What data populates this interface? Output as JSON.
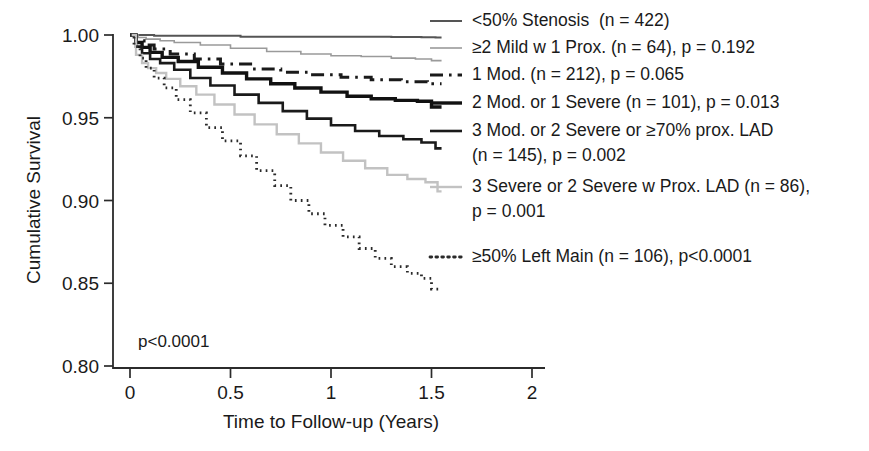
{
  "figure": {
    "background": "#ffffff",
    "annotation": "p<0.0001"
  },
  "chart_data": {
    "type": "line",
    "subtype": "kaplan-meier-survival",
    "title": "",
    "xlabel": "Time to Follow-up (Years)",
    "ylabel": "Cumulative Survival",
    "xlim": [
      0,
      2
    ],
    "ylim": [
      0.8,
      1.0
    ],
    "xticks": [
      0,
      0.5,
      1,
      1.5,
      2
    ],
    "xtick_labels": [
      "0",
      "0.5",
      "1",
      "1.5",
      "2"
    ],
    "yticks": [
      0.8,
      0.85,
      0.9,
      0.95,
      1.0
    ],
    "ytick_labels": [
      "0.80",
      "0.85",
      "0.90",
      "0.95",
      "1.00"
    ],
    "grid": false,
    "legend_position": "right",
    "overall_p_value": "p<0.0001",
    "series": [
      {
        "name": "<50% Stenosis  (n = 422)",
        "group": "<50% Stenosis",
        "n": 422,
        "p": null,
        "p_label": "",
        "color": "#555555",
        "style": "solid",
        "width": 2.0,
        "final_survival": 0.9985,
        "x": [
          0,
          0.05,
          0.12,
          0.3,
          0.55,
          0.82,
          1.05,
          1.3,
          1.45,
          1.52,
          1.55
        ],
        "y": [
          1.0,
          1.0,
          0.9995,
          0.9995,
          0.999,
          0.999,
          0.999,
          0.9988,
          0.9986,
          0.9985,
          0.9985
        ]
      },
      {
        "name": "≥2 Mild w 1 Prox. (n = 64), p = 0.192",
        "group": "≥2 Mild w 1 Prox.",
        "n": 64,
        "p": 0.192,
        "p_label": "p = 0.192",
        "color": "#9a9a9a",
        "style": "solid",
        "width": 1.6,
        "final_survival": 0.9845,
        "x": [
          0,
          0.04,
          0.08,
          0.15,
          0.22,
          0.35,
          0.5,
          0.68,
          0.85,
          1.0,
          1.15,
          1.3,
          1.42,
          1.5,
          1.55
        ],
        "y": [
          1.0,
          0.9985,
          0.9975,
          0.9965,
          0.9955,
          0.994,
          0.992,
          0.99,
          0.9885,
          0.9875,
          0.987,
          0.986,
          0.9855,
          0.9845,
          0.9845
        ]
      },
      {
        "name": "1 Mod. (n = 212), p = 0.065",
        "group": "1 Mod.",
        "n": 212,
        "p": 0.065,
        "p_label": "p = 0.065",
        "color": "#1a1a1a",
        "style": "dashdot",
        "width": 3.0,
        "final_survival": 0.9705,
        "x": [
          0,
          0.03,
          0.07,
          0.12,
          0.2,
          0.32,
          0.45,
          0.6,
          0.75,
          0.9,
          1.05,
          1.2,
          1.35,
          1.48,
          1.55
        ],
        "y": [
          1.0,
          0.9965,
          0.994,
          0.9915,
          0.9885,
          0.9855,
          0.9825,
          0.9795,
          0.9775,
          0.976,
          0.9745,
          0.973,
          0.9718,
          0.9705,
          0.9705
        ]
      },
      {
        "name": "2 Mod. or 1 Severe (n = 101), p = 0.013",
        "group": "2 Mod. or 1 Severe",
        "n": 101,
        "p": 0.013,
        "p_label": "p = 0.013",
        "color": "#111111",
        "style": "solid",
        "width": 3.4,
        "final_survival": 0.9565,
        "x": [
          0,
          0.03,
          0.06,
          0.1,
          0.16,
          0.24,
          0.34,
          0.46,
          0.58,
          0.7,
          0.82,
          0.95,
          1.08,
          1.2,
          1.32,
          1.43,
          1.5,
          1.55
        ],
        "y": [
          1.0,
          0.9955,
          0.9925,
          0.9895,
          0.9865,
          0.984,
          0.9805,
          0.977,
          0.9735,
          0.9705,
          0.968,
          0.9655,
          0.963,
          0.9615,
          0.9605,
          0.96,
          0.9565,
          0.9565
        ]
      },
      {
        "name": "3 Mod. or 2 Severe or ≥70% prox. LAD (n = 145), p = 0.002",
        "group": "3 Mod. or 2 Severe or ≥70% prox. LAD",
        "n": 145,
        "p": 0.002,
        "p_label": "p = 0.002",
        "color": "#1a1a1a",
        "style": "solid",
        "width": 2.6,
        "final_survival": 0.9315,
        "x": [
          0,
          0.03,
          0.06,
          0.1,
          0.15,
          0.22,
          0.3,
          0.4,
          0.52,
          0.64,
          0.76,
          0.88,
          1.0,
          1.12,
          1.24,
          1.36,
          1.45,
          1.52,
          1.55
        ],
        "y": [
          1.0,
          0.993,
          0.989,
          0.9855,
          0.983,
          0.979,
          0.974,
          0.9695,
          0.964,
          0.959,
          0.954,
          0.9495,
          0.9455,
          0.942,
          0.939,
          0.937,
          0.935,
          0.9315,
          0.9315
        ]
      },
      {
        "name": "3 Severe or 2 Severe w Prox. LAD (n = 86), p = 0.001",
        "group": "3 Severe or 2 Severe w Prox. LAD",
        "n": 86,
        "p": 0.001,
        "p_label": "p = 0.001",
        "color": "#c2c2c2",
        "style": "solid",
        "width": 2.4,
        "final_survival": 0.9055,
        "x": [
          0,
          0.03,
          0.06,
          0.09,
          0.13,
          0.18,
          0.25,
          0.33,
          0.42,
          0.52,
          0.62,
          0.73,
          0.84,
          0.95,
          1.06,
          1.17,
          1.28,
          1.38,
          1.47,
          1.53,
          1.55
        ],
        "y": [
          1.0,
          0.988,
          0.983,
          0.98,
          0.977,
          0.9735,
          0.969,
          0.964,
          0.958,
          0.952,
          0.946,
          0.94,
          0.9345,
          0.929,
          0.924,
          0.9195,
          0.9155,
          0.913,
          0.911,
          0.9055,
          0.9055
        ]
      },
      {
        "name": "≥50% Left Main (n = 106), p<0.0001",
        "group": "≥50% Left Main",
        "n": 106,
        "p": 0.0001,
        "p_label": "p<0.0001",
        "color": "#2a2a2a",
        "style": "dotted",
        "width": 2.8,
        "final_survival": 0.8465,
        "x": [
          0,
          0.02,
          0.05,
          0.08,
          0.12,
          0.17,
          0.23,
          0.3,
          0.38,
          0.46,
          0.55,
          0.63,
          0.72,
          0.8,
          0.89,
          0.97,
          1.06,
          1.14,
          1.22,
          1.3,
          1.38,
          1.45,
          1.5,
          1.55
        ],
        "y": [
          1.0,
          0.993,
          0.986,
          0.98,
          0.974,
          0.968,
          0.961,
          0.953,
          0.944,
          0.936,
          0.927,
          0.918,
          0.909,
          0.9,
          0.892,
          0.885,
          0.878,
          0.871,
          0.865,
          0.86,
          0.856,
          0.853,
          0.8465,
          0.8465
        ]
      }
    ]
  },
  "legend": {
    "entries": [
      {
        "label": "<50% Stenosis  (n = 422)",
        "line2": "",
        "swatch": "solid-gray"
      },
      {
        "label": "≥2 Mild w 1 Prox. (n = 64), p = 0.192",
        "line2": "",
        "swatch": "solid-lightgray"
      },
      {
        "label": "1 Mod. (n = 212), p = 0.065",
        "line2": "",
        "swatch": "dashdot-black"
      },
      {
        "label": "2 Mod. or 1 Severe (n = 101), p = 0.013",
        "line2": "",
        "swatch": "solid-black-thick"
      },
      {
        "label": "3 Mod. or 2 Severe or ≥70% prox. LAD",
        "line2": "(n = 145), p = 0.002",
        "swatch": "solid-black"
      },
      {
        "label": "3 Severe or 2 Severe w Prox. LAD (n = 86),",
        "line2": "p = 0.001",
        "swatch": "solid-palegray"
      },
      {
        "label": "≥50% Left Main (n = 106), p<0.0001",
        "line2": "",
        "swatch": "dotted-black"
      }
    ]
  }
}
